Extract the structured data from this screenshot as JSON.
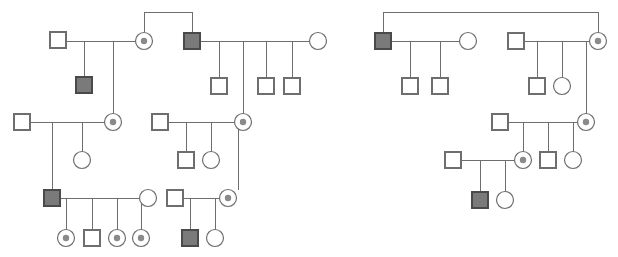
{
  "figure": {
    "name": "pedigree-chart",
    "type": "genetic-pedigree-diagram",
    "width": 618,
    "height": 257,
    "background_color": "#ffffff",
    "line_color": "#6e6e6e",
    "affected_fill_color": "#7a7a7a",
    "carrier_dot_color": "#8a8a8a",
    "unaffected_fill_color": "#ffffff",
    "caption": "",
    "title": ""
  },
  "legend": {
    "symbols": [
      {
        "key": "male-unaffected",
        "shape": "square",
        "fill": "white",
        "label": ""
      },
      {
        "key": "male-affected",
        "shape": "square",
        "fill": "gray",
        "label": ""
      },
      {
        "key": "female-unaffected",
        "shape": "circle",
        "fill": "white",
        "label": ""
      },
      {
        "key": "female-carrier",
        "shape": "circle-with-center-dot",
        "fill": "white",
        "label": ""
      }
    ]
  },
  "symbol_geometry": {
    "square_size": 16,
    "circle_radius": 8.5,
    "carrier_dot_radius": 3.2
  },
  "pedigrees": [
    {
      "id": "pedigree-left",
      "label": "",
      "individuals": [
        {
          "id": "L-I-1",
          "type": "male-unaffected",
          "x": 58,
          "y": 40
        },
        {
          "id": "L-I-2",
          "type": "female-carrier",
          "x": 144,
          "y": 41
        },
        {
          "id": "L-I-3",
          "type": "male-affected",
          "x": 192,
          "y": 41
        },
        {
          "id": "L-I-4",
          "type": "female-unaffected",
          "x": 318,
          "y": 41
        },
        {
          "id": "L-II-1",
          "type": "male-affected",
          "x": 84,
          "y": 85
        },
        {
          "id": "L-II-2",
          "type": "male-unaffected",
          "x": 219,
          "y": 86
        },
        {
          "id": "L-II-3",
          "type": "male-unaffected",
          "x": 266,
          "y": 86
        },
        {
          "id": "L-II-4",
          "type": "male-unaffected",
          "x": 292,
          "y": 86
        },
        {
          "id": "L-II-5",
          "type": "male-unaffected",
          "x": 22,
          "y": 122
        },
        {
          "id": "L-II-6",
          "type": "female-carrier",
          "x": 113,
          "y": 122
        },
        {
          "id": "L-II-7",
          "type": "male-unaffected",
          "x": 160,
          "y": 122
        },
        {
          "id": "L-II-8",
          "type": "female-carrier",
          "x": 243,
          "y": 122
        },
        {
          "id": "L-III-1",
          "type": "female-unaffected",
          "x": 82,
          "y": 160
        },
        {
          "id": "L-III-2",
          "type": "male-unaffected",
          "x": 186,
          "y": 160
        },
        {
          "id": "L-III-3",
          "type": "female-unaffected",
          "x": 211,
          "y": 160
        },
        {
          "id": "L-III-4",
          "type": "male-affected",
          "x": 52,
          "y": 198
        },
        {
          "id": "L-III-5",
          "type": "female-unaffected",
          "x": 148,
          "y": 198
        },
        {
          "id": "L-III-6",
          "type": "male-unaffected",
          "x": 175,
          "y": 198
        },
        {
          "id": "L-III-7",
          "type": "female-carrier",
          "x": 228,
          "y": 198
        },
        {
          "id": "L-IV-1",
          "type": "female-carrier",
          "x": 66,
          "y": 238
        },
        {
          "id": "L-IV-2",
          "type": "male-unaffected",
          "x": 92,
          "y": 238
        },
        {
          "id": "L-IV-3",
          "type": "female-carrier",
          "x": 117,
          "y": 238
        },
        {
          "id": "L-IV-4",
          "type": "female-carrier",
          "x": 141,
          "y": 238
        },
        {
          "id": "L-IV-5",
          "type": "male-affected",
          "x": 190,
          "y": 238
        },
        {
          "id": "L-IV-6",
          "type": "female-unaffected",
          "x": 215,
          "y": 238
        }
      ]
    },
    {
      "id": "pedigree-right",
      "label": "",
      "individuals": [
        {
          "id": "R-I-1",
          "type": "male-affected",
          "x": 383,
          "y": 41
        },
        {
          "id": "R-I-2",
          "type": "female-unaffected",
          "x": 468,
          "y": 41
        },
        {
          "id": "R-I-3",
          "type": "male-unaffected",
          "x": 516,
          "y": 41
        },
        {
          "id": "R-I-4",
          "type": "female-carrier",
          "x": 598,
          "y": 41
        },
        {
          "id": "R-II-1",
          "type": "male-unaffected",
          "x": 410,
          "y": 86
        },
        {
          "id": "R-II-2",
          "type": "male-unaffected",
          "x": 440,
          "y": 86
        },
        {
          "id": "R-II-3",
          "type": "male-unaffected",
          "x": 537,
          "y": 86
        },
        {
          "id": "R-II-4",
          "type": "female-unaffected",
          "x": 562,
          "y": 86
        },
        {
          "id": "R-II-5",
          "type": "male-unaffected",
          "x": 500,
          "y": 122
        },
        {
          "id": "R-II-6",
          "type": "female-carrier",
          "x": 586,
          "y": 122
        },
        {
          "id": "R-III-1",
          "type": "female-carrier",
          "x": 523,
          "y": 160
        },
        {
          "id": "R-III-2",
          "type": "male-unaffected",
          "x": 548,
          "y": 160
        },
        {
          "id": "R-III-3",
          "type": "female-unaffected",
          "x": 573,
          "y": 160
        },
        {
          "id": "R-III-4",
          "type": "male-unaffected",
          "x": 453,
          "y": 160
        },
        {
          "id": "R-IV-1",
          "type": "male-affected",
          "x": 480,
          "y": 200
        },
        {
          "id": "R-IV-2",
          "type": "female-unaffected",
          "x": 505,
          "y": 200
        }
      ]
    }
  ]
}
